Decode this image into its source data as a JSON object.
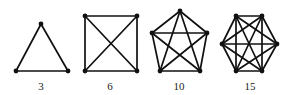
{
  "figure": {
    "graphs": [
      {
        "name": "K3",
        "label": "3",
        "label_pos": [
          41,
          90
        ],
        "vertices": [
          [
            41,
            24
          ],
          [
            16,
            71
          ],
          [
            68,
            71
          ]
        ]
      },
      {
        "name": "K4",
        "label": "6",
        "label_pos": [
          110,
          90
        ],
        "vertices": [
          [
            85,
            16
          ],
          [
            137,
            16
          ],
          [
            137,
            71
          ],
          [
            85,
            71
          ]
        ]
      },
      {
        "name": "K5",
        "label": "10",
        "label_pos": [
          179,
          90
        ],
        "vertices": [
          [
            180,
            11
          ],
          [
            207,
            33
          ],
          [
            200,
            71
          ],
          [
            160,
            71
          ],
          [
            152,
            33
          ]
        ]
      },
      {
        "name": "K6",
        "label": "15",
        "label_pos": [
          250,
          90
        ],
        "vertices": [
          [
            236,
            16
          ],
          [
            262,
            16
          ],
          [
            277,
            44
          ],
          [
            262,
            71
          ],
          [
            236,
            71
          ],
          [
            222,
            44
          ]
        ]
      }
    ],
    "colors": {
      "edge": "#111111",
      "vertex": "#111111",
      "label": "#222222"
    }
  }
}
